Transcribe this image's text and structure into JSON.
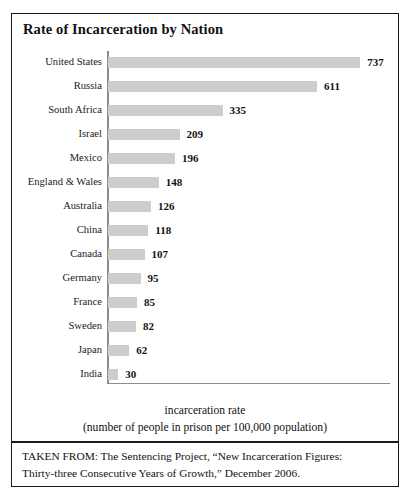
{
  "chart_data": {
    "type": "bar",
    "orientation": "horizontal",
    "title": "Rate of Incarceration by Nation",
    "categories": [
      "United States",
      "Russia",
      "South Africa",
      "Israel",
      "Mexico",
      "England & Wales",
      "Australia",
      "China",
      "Canada",
      "Germany",
      "France",
      "Sweden",
      "Japan",
      "India"
    ],
    "values": [
      737,
      611,
      335,
      209,
      196,
      148,
      126,
      118,
      107,
      95,
      85,
      82,
      62,
      30
    ],
    "value_labels": [
      "737",
      "611",
      "335",
      "209",
      "196",
      "148",
      "126",
      "118",
      "107",
      "95",
      "85",
      "82",
      "62",
      "30"
    ],
    "xlabel": "incarceration rate",
    "xlabel_sub": "(number of people in prison per 100,000 population)",
    "ylabel": "",
    "xlim": [
      0,
      790
    ],
    "grid": false,
    "legend": false,
    "bar_color": "#cdcdcd",
    "axis_color": "#8c8c8c",
    "text_color": "#111111"
  },
  "axis_caption": {
    "line1": "incarceration rate",
    "line2": "(number of people in prison per 100,000 population)"
  },
  "source": {
    "line1": "TAKEN FROM: The Sentencing Project, “New Incarceration Figures:",
    "line2": "Thirty-three Consecutive Years of Growth,” December 2006."
  }
}
